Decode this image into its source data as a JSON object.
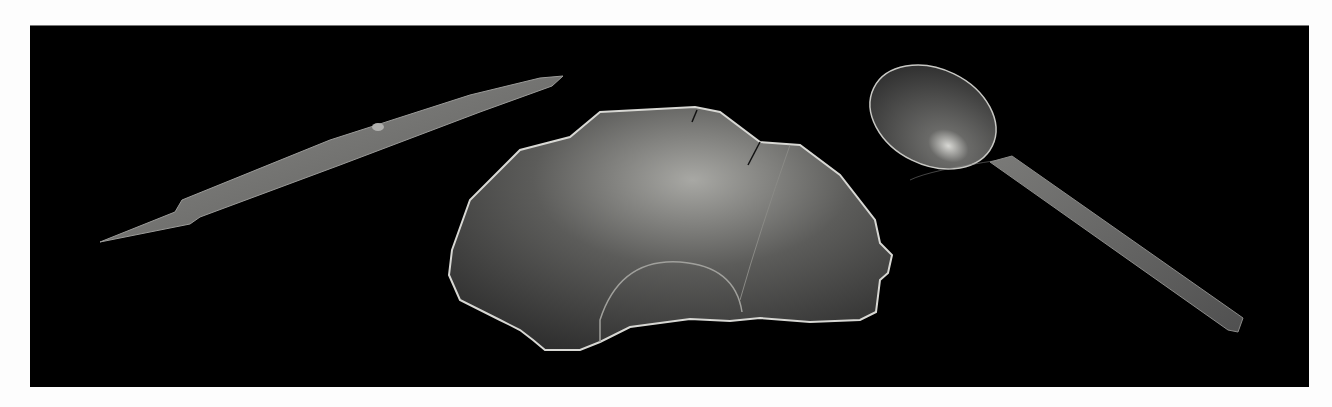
{
  "photo": {
    "background_color": "#000000",
    "border_color": "#fdfdfd",
    "objects": [
      {
        "name": "iron knife blade",
        "tone": "#8a8a88"
      },
      {
        "name": "wooden bowl fragment",
        "tone": "#6e6e6c"
      },
      {
        "name": "spoon",
        "tone": "#5a5a58"
      }
    ]
  }
}
